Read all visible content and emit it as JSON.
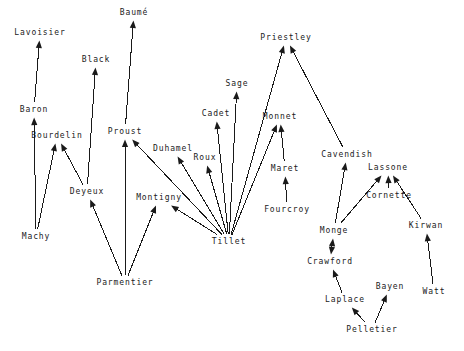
{
  "diagram": {
    "type": "directed-graph",
    "background_color": "#ffffff",
    "line_color": "#1a1a1a",
    "text_color": "#1a1a1a",
    "width": 464,
    "height": 351,
    "nodes": [
      {
        "id": "lavoisier",
        "label": "Lavoisier",
        "x": 40,
        "y": 33
      },
      {
        "id": "baume",
        "label": "Baumé",
        "x": 134,
        "y": 13
      },
      {
        "id": "priestley",
        "label": "Priestley",
        "x": 286,
        "y": 38
      },
      {
        "id": "black",
        "label": "Black",
        "x": 96,
        "y": 60
      },
      {
        "id": "sage",
        "label": "Sage",
        "x": 237,
        "y": 84
      },
      {
        "id": "baron",
        "label": "Baron",
        "x": 34,
        "y": 110
      },
      {
        "id": "cadet",
        "label": "Cadet",
        "x": 216,
        "y": 114
      },
      {
        "id": "monnet",
        "label": "Monnet",
        "x": 280,
        "y": 117
      },
      {
        "id": "bourdelin",
        "label": "Bourdelin",
        "x": 57,
        "y": 136
      },
      {
        "id": "proust",
        "label": "Proust",
        "x": 125,
        "y": 132
      },
      {
        "id": "duhamel",
        "label": "Duhamel",
        "x": 173,
        "y": 149
      },
      {
        "id": "roux",
        "label": "Roux",
        "x": 205,
        "y": 158
      },
      {
        "id": "cavendish",
        "label": "Cavendish",
        "x": 347,
        "y": 155
      },
      {
        "id": "maret",
        "label": "Maret",
        "x": 285,
        "y": 169
      },
      {
        "id": "lassone",
        "label": "Lassone",
        "x": 388,
        "y": 168
      },
      {
        "id": "deyeux",
        "label": "Deyeux",
        "x": 87,
        "y": 192
      },
      {
        "id": "cornette",
        "label": "Cornette",
        "x": 389,
        "y": 196
      },
      {
        "id": "montigny",
        "label": "Montigny",
        "x": 159,
        "y": 198
      },
      {
        "id": "fourcroy",
        "label": "Fourcroy",
        "x": 287,
        "y": 210
      },
      {
        "id": "kirwan",
        "label": "Kirwan",
        "x": 426,
        "y": 226
      },
      {
        "id": "machy",
        "label": "Machy",
        "x": 36,
        "y": 237
      },
      {
        "id": "tillet",
        "label": "Tillet",
        "x": 229,
        "y": 242
      },
      {
        "id": "monge",
        "label": "Monge",
        "x": 334,
        "y": 231
      },
      {
        "id": "crawford",
        "label": "Crawford",
        "x": 330,
        "y": 262
      },
      {
        "id": "parmentier",
        "label": "Parmentier",
        "x": 125,
        "y": 283
      },
      {
        "id": "bayen",
        "label": "Bayen",
        "x": 390,
        "y": 287
      },
      {
        "id": "watt",
        "label": "Watt",
        "x": 434,
        "y": 292
      },
      {
        "id": "laplace",
        "label": "Laplace",
        "x": 345,
        "y": 300
      },
      {
        "id": "pelletier",
        "label": "Pelletier",
        "x": 372,
        "y": 330
      }
    ],
    "edges": [
      {
        "from": "baron",
        "to": "lavoisier",
        "bidirectional": false
      },
      {
        "from": "machy",
        "to": "baron",
        "bidirectional": false
      },
      {
        "from": "machy",
        "to": "bourdelin",
        "bidirectional": false
      },
      {
        "from": "deyeux",
        "to": "bourdelin",
        "bidirectional": false
      },
      {
        "from": "deyeux",
        "to": "black",
        "bidirectional": false
      },
      {
        "from": "parmentier",
        "to": "deyeux",
        "bidirectional": false
      },
      {
        "from": "parmentier",
        "to": "proust",
        "bidirectional": false
      },
      {
        "from": "parmentier",
        "to": "montigny",
        "bidirectional": false
      },
      {
        "from": "proust",
        "to": "baume",
        "bidirectional": false
      },
      {
        "from": "tillet",
        "to": "proust",
        "bidirectional": false
      },
      {
        "from": "tillet",
        "to": "montigny",
        "bidirectional": false
      },
      {
        "from": "tillet",
        "to": "duhamel",
        "bidirectional": false
      },
      {
        "from": "tillet",
        "to": "roux",
        "bidirectional": false
      },
      {
        "from": "tillet",
        "to": "cadet",
        "bidirectional": false
      },
      {
        "from": "tillet",
        "to": "sage",
        "bidirectional": false
      },
      {
        "from": "tillet",
        "to": "monnet",
        "bidirectional": false
      },
      {
        "from": "tillet",
        "to": "priestley",
        "bidirectional": false
      },
      {
        "from": "maret",
        "to": "monnet",
        "bidirectional": false
      },
      {
        "from": "fourcroy",
        "to": "maret",
        "bidirectional": false
      },
      {
        "from": "cavendish",
        "to": "priestley",
        "bidirectional": false
      },
      {
        "from": "monge",
        "to": "cavendish",
        "bidirectional": false
      },
      {
        "from": "monge",
        "to": "lassone",
        "bidirectional": false
      },
      {
        "from": "cornette",
        "to": "lassone",
        "bidirectional": false
      },
      {
        "from": "kirwan",
        "to": "lassone",
        "bidirectional": false
      },
      {
        "from": "watt",
        "to": "kirwan",
        "bidirectional": false
      },
      {
        "from": "monge",
        "to": "crawford",
        "bidirectional": true
      },
      {
        "from": "laplace",
        "to": "crawford",
        "bidirectional": false
      },
      {
        "from": "pelletier",
        "to": "laplace",
        "bidirectional": false
      },
      {
        "from": "pelletier",
        "to": "bayen",
        "bidirectional": false
      }
    ]
  }
}
